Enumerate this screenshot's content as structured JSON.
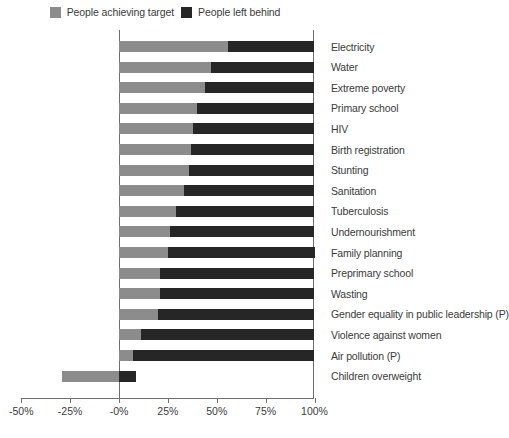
{
  "chart_data": {
    "type": "bar",
    "orientation": "horizontal",
    "stacked": true,
    "title": "",
    "subtitle": "",
    "xlabel": "",
    "ylabel": "",
    "xlim": [
      -50,
      100
    ],
    "xticks": [
      -50,
      -25,
      0,
      25,
      50,
      75,
      100
    ],
    "xtick_labels": [
      "-50%",
      "-25%",
      "-0%",
      "25%",
      "50%",
      "75%",
      "100%"
    ],
    "grid": false,
    "legend_position": "top-center",
    "legend": [
      {
        "name": "People achieving target",
        "color": "#8c8c8c"
      },
      {
        "name": "People left behind",
        "color": "#262626"
      }
    ],
    "categories": [
      "Electricity",
      "Water",
      "Extreme poverty",
      "Primary school",
      "HIV",
      "Birth registration",
      "Stunting",
      "Sanitation",
      "Tuberculosis",
      "Undernourishment",
      "Family planning",
      "Preprimary school",
      "Wasting",
      "Gender equality in public leadership (P)",
      "Violence against women",
      "Air pollution (P)",
      "Children overweight"
    ],
    "series": [
      {
        "name": "People achieving target",
        "color": "#8c8c8c",
        "values": [
          56,
          47,
          44,
          40,
          38,
          37,
          36,
          33,
          29,
          26,
          25,
          21,
          21,
          20,
          11,
          7,
          -29
        ]
      },
      {
        "name": "People left behind",
        "color": "#262626",
        "values": [
          44,
          53,
          56,
          60,
          62,
          63,
          64,
          67,
          71,
          74,
          75,
          79,
          79,
          80,
          89,
          93,
          29
        ]
      }
    ]
  },
  "legend": {
    "items": [
      {
        "label": "People achieving target",
        "swatch": "legend-swatch-light"
      },
      {
        "label": "People left behind",
        "swatch": "legend-swatch-dark"
      }
    ]
  },
  "axis": {
    "ticks": [
      {
        "label": "-50%",
        "value": -50
      },
      {
        "label": "-25%",
        "value": -25
      },
      {
        "label": "-0%",
        "value": 0
      },
      {
        "label": "25%",
        "value": 25
      },
      {
        "label": "50%",
        "value": 50
      },
      {
        "label": "75%",
        "value": 75
      },
      {
        "label": "100%",
        "value": 100
      }
    ]
  },
  "colors": {
    "achieving": "#8c8c8c",
    "left_behind": "#262626",
    "axis": "#6e6e6e",
    "text": "#3b3b3b",
    "background": "#ffffff"
  }
}
